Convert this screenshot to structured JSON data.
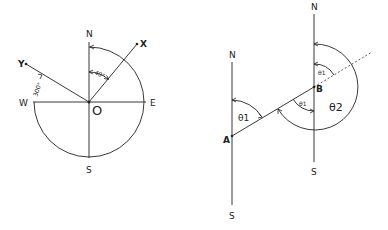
{
  "left_diagram": {
    "labels": {
      "north": "N",
      "south": "S",
      "east": "E",
      "west": "W",
      "origin": "O",
      "point_x": "X",
      "point_y": "Y"
    },
    "angles": {
      "x_bearing": "40°",
      "y_bearing": "300°"
    }
  },
  "right_diagram": {
    "labels": {
      "north_a": "N",
      "south_a": "S",
      "north_b": "N",
      "south_b": "S",
      "point_a": "A",
      "point_b": "B"
    },
    "angles": {
      "theta1_at_a": "θ1",
      "theta1_at_b_alt": "θ1",
      "theta1_at_b_top": "θ1",
      "theta2": "θ2"
    }
  }
}
